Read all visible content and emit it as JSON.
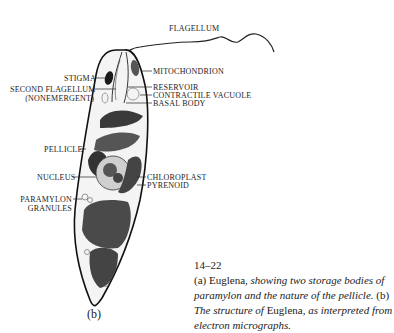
{
  "figure": {
    "panel_label": "(b)",
    "labels": {
      "flagellum": "FLAGELLUM",
      "mitochondrion": "MITOCHONDRION",
      "stigma": "STIGMA",
      "second_flagellum_1": "SECOND FLAGELLUM",
      "second_flagellum_2": "(NONEMERGENT)",
      "reservoir": "RESERVOIR",
      "contractile_vacuole": "CONTRACTILE VACUOLE",
      "basal_body": "BASAL BODY",
      "pellicle": "PELLICLE",
      "nucleus": "NUCLEUS",
      "chloroplast": "CHLOROPLAST",
      "pyrenoid": "PYRENOID",
      "paramylon_1": "PARAMYLON",
      "paramylon_2": "GRANULES"
    }
  },
  "caption": {
    "number": "14–22",
    "a_label": "(a) ",
    "a_name": "Euglena",
    "a_text": ", showing two storage bodies of paramylon and the nature of the pellicle.",
    "b_label": " (b) ",
    "b_text1": "The structure of ",
    "b_name": "Euglena",
    "b_text2": ", as interpreted from electron micrographs."
  }
}
